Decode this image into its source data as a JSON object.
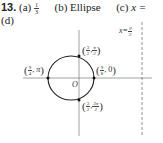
{
  "problem": {
    "number": "13.",
    "parts": [
      {
        "label": "(a)",
        "answer_num": "1",
        "answer_den": "3"
      },
      {
        "label": "(b)",
        "answer": "Ellipse"
      },
      {
        "label": "(c)",
        "answer_prefix": "x ="
      },
      {
        "label": "(d)"
      }
    ]
  },
  "figure": {
    "directrix_label": {
      "var": "x",
      "eq": "=",
      "num": "9",
      "den": "2"
    },
    "origin_label": "O",
    "points": [
      {
        "name": "top",
        "r_num": "3",
        "r_den": "2",
        "theta_num": "π",
        "theta_den": "2"
      },
      {
        "name": "left",
        "r_num": "9",
        "r_den": "4",
        "theta": "π"
      },
      {
        "name": "right",
        "r_num": "9",
        "r_den": "8",
        "theta": "0"
      },
      {
        "name": "bottom",
        "r_num": "3",
        "r_den": "2",
        "theta_num": "3π",
        "theta_den": "2"
      }
    ],
    "colors": {
      "curve": "#222222",
      "axis": "#888888",
      "dashed": "#777777"
    }
  }
}
